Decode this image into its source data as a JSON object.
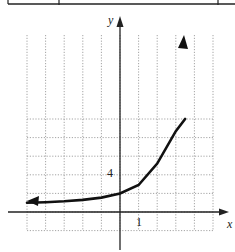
{
  "table_fragment": {
    "border_y": 4,
    "column_dividers_x": [
      8,
      59,
      218
    ]
  },
  "chart_data": {
    "type": "line",
    "title": "",
    "xlabel": "x",
    "ylabel": "y",
    "tick_labels": {
      "x": "1",
      "y": "4"
    },
    "x_grid_step": 1,
    "y_grid_step": 2,
    "xlim": [
      -5,
      5
    ],
    "ylim": [
      -2,
      10
    ],
    "grid": true,
    "series": [
      {
        "name": "exponential curve",
        "x": [
          -5,
          -4,
          -3,
          -2,
          -1,
          0,
          1,
          2,
          3,
          3.5
        ],
        "y": [
          1.0,
          1.05,
          1.15,
          1.3,
          1.55,
          2.0,
          2.9,
          5.2,
          8.7,
          10
        ],
        "arrows": [
          "left",
          "right"
        ],
        "horizontal_asymptote": 1
      }
    ]
  },
  "labels": {
    "x_axis": "x",
    "y_axis": "y",
    "x_tick": "1",
    "y_tick": "4"
  },
  "colors": {
    "grid": "#9a9a9a",
    "axis": "#222222",
    "curve": "#111111",
    "background": "#ffffff"
  }
}
